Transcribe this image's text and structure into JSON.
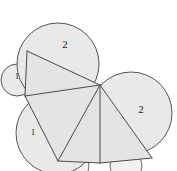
{
  "figure": {
    "background_color": "#ffffff",
    "fill_color": "#e9e9e9",
    "stroke_color": "#565656",
    "width": 177,
    "height": 171
  },
  "labels": [
    {
      "id": "label-top-radius-2",
      "text": "2",
      "x": 65,
      "y": 45,
      "size": "big"
    },
    {
      "id": "label-right-radius-2",
      "text": "2",
      "x": 141,
      "y": 110,
      "size": "big"
    },
    {
      "id": "label-left-radius-1",
      "text": "1",
      "x": 17,
      "y": 77,
      "size": "small"
    },
    {
      "id": "label-lower-radius-1",
      "text": "1",
      "x": 33,
      "y": 133,
      "size": "small"
    }
  ],
  "circles": [
    {
      "id": "circle-top-large",
      "cx": 58,
      "cy": 64,
      "r": 41,
      "label": "2"
    },
    {
      "id": "circle-right-large",
      "cx": 131,
      "cy": 113,
      "r": 41,
      "label": "2"
    },
    {
      "id": "circle-left-small",
      "cx": 17,
      "cy": 80,
      "r": 16,
      "label": "1"
    },
    {
      "id": "circle-lower-left-medium",
      "cx": 57,
      "cy": 133,
      "r": 41,
      "label": "1"
    },
    {
      "id": "circle-bottom-small-left",
      "cx": 73,
      "cy": 166,
      "r": 16,
      "label": ""
    },
    {
      "id": "circle-bottom-small-right",
      "cx": 126,
      "cy": 166,
      "r": 16,
      "label": ""
    }
  ],
  "vertices": {
    "center": {
      "x": 100,
      "y": 85
    },
    "upper_left": {
      "x": 27,
      "y": 51
    },
    "left": {
      "x": 25,
      "y": 96
    },
    "lower_left": {
      "x": 58,
      "y": 161
    },
    "bottom_center": {
      "x": 100,
      "y": 163
    },
    "lower_right": {
      "x": 152,
      "y": 158
    }
  },
  "chords": [
    {
      "id": "chord-center-to-upper-left",
      "from": "center",
      "to": "upper_left"
    },
    {
      "id": "chord-center-to-left",
      "from": "center",
      "to": "left"
    },
    {
      "id": "chord-center-to-lower-left",
      "from": "center",
      "to": "lower_left"
    },
    {
      "id": "chord-center-to-bottom-center",
      "from": "center",
      "to": "bottom_center"
    },
    {
      "id": "chord-center-to-lower-right",
      "from": "center",
      "to": "lower_right"
    },
    {
      "id": "chord-upper-left-to-left",
      "from": "upper_left",
      "to": "left"
    },
    {
      "id": "chord-left-to-lower-left",
      "from": "left",
      "to": "lower_left"
    },
    {
      "id": "chord-lower-left-to-bottom-center",
      "from": "lower_left",
      "to": "bottom_center"
    },
    {
      "id": "chord-bottom-center-to-lower-right",
      "from": "bottom_center",
      "to": "lower_right"
    }
  ]
}
